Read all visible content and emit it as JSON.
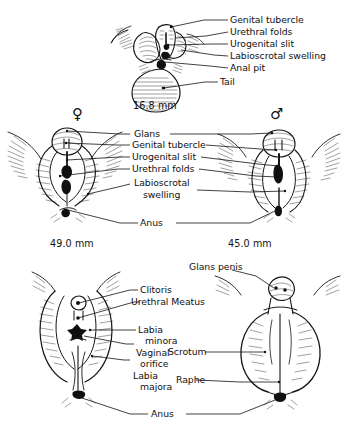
{
  "figure": {
    "type": "anatomical-line-drawing",
    "panels": [
      {
        "id": "indifferent-stage",
        "measurement": "16.8 mm",
        "sex_symbol": "",
        "labels": [
          "Genital tubercle",
          "Urethral folds",
          "Urogenital slit",
          "Labioscrotal swelling",
          "Anal pit",
          "Tail"
        ]
      },
      {
        "id": "differentiating-stage",
        "female_measurement": "49.0 mm",
        "male_measurement": "45.0 mm",
        "female_symbol": "♀",
        "male_symbol": "♂",
        "labels": [
          "Glans",
          "Genital tubercle",
          "Urogenital slit",
          "Urethral folds",
          "Labioscrotal",
          "swelling",
          "Anus"
        ]
      },
      {
        "id": "differentiated-stage",
        "female_labels": [
          "Clitoris",
          "Urethral Meatus",
          "Labia",
          "minora",
          "Vaginal",
          "orifice",
          "Labia",
          "majora"
        ],
        "male_labels": [
          "Glans penis",
          "Scrotum",
          "Raphe"
        ],
        "shared_labels": [
          "Anus"
        ]
      }
    ]
  },
  "top_panel": {
    "measurement": "16.8 mm",
    "label_genital_tubercle": "Genital tubercle",
    "label_urethral_folds": "Urethral folds",
    "label_urogenital_slit": "Urogenital slit",
    "label_labioscrotal_swelling": "Labioscrotal swelling",
    "label_anal_pit": "Anal pit",
    "label_tail": "Tail"
  },
  "middle_panel": {
    "female_symbol": "♀",
    "male_symbol": "♂",
    "female_measurement": "49.0 mm",
    "male_measurement": "45.0 mm",
    "label_glans": "Glans",
    "label_genital_tubercle": "Genital tubercle",
    "label_urogenital_slit": "Urogenital slit",
    "label_urethral_folds": "Urethral folds",
    "label_labioscrotal": "Labioscrotal",
    "label_swelling": "swelling",
    "label_anus": "Anus"
  },
  "bottom_panel": {
    "label_glans_penis": "Glans penis",
    "label_clitoris": "Clitoris",
    "label_urethral_meatus": "Urethral Meatus",
    "label_labia_1": "Labia",
    "label_minora": "minora",
    "label_vaginal": "Vaginal",
    "label_orifice": "orifice",
    "label_labia_2": "Labia",
    "label_majora": "majora",
    "label_scrotum": "Scrotum",
    "label_raphe": "Raphe",
    "label_anus": "Anus"
  },
  "colors": {
    "ink": "#151515",
    "background": "#ffffff"
  }
}
